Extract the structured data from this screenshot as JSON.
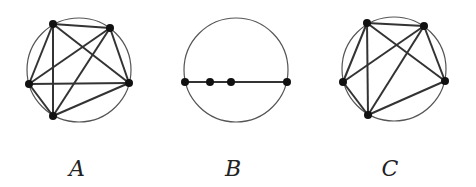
{
  "figures": [
    {
      "label": "A",
      "circle": {
        "cx": 79,
        "cy": 70,
        "r": 52
      },
      "points": [
        [
          53,
          24
        ],
        [
          110,
          28
        ],
        [
          129,
          83
        ],
        [
          53,
          116
        ],
        [
          29,
          84
        ]
      ],
      "edges": [
        [
          0,
          1
        ],
        [
          0,
          2
        ],
        [
          0,
          3
        ],
        [
          0,
          4
        ],
        [
          1,
          2
        ],
        [
          1,
          3
        ],
        [
          1,
          4
        ],
        [
          2,
          3
        ],
        [
          2,
          4
        ],
        [
          3,
          4
        ]
      ],
      "label_pos": [
        77,
        168
      ]
    },
    {
      "label": "B",
      "circle": {
        "cx": 236,
        "cy": 70,
        "r": 52
      },
      "points": [
        [
          185,
          82
        ],
        [
          210,
          82
        ],
        [
          231,
          82
        ],
        [
          287,
          82
        ]
      ],
      "edges": [
        [
          0,
          1
        ],
        [
          1,
          2
        ],
        [
          2,
          3
        ]
      ],
      "label_pos": [
        233,
        168
      ]
    },
    {
      "label": "C",
      "circle": {
        "cx": 394,
        "cy": 69,
        "r": 52
      },
      "points": [
        [
          367,
          23
        ],
        [
          424,
          26
        ],
        [
          445,
          81
        ],
        [
          368,
          115
        ],
        [
          343,
          82
        ]
      ],
      "edges": [
        [
          0,
          1
        ],
        [
          0,
          2
        ],
        [
          0,
          3
        ],
        [
          0,
          4
        ],
        [
          1,
          2
        ],
        [
          1,
          3
        ],
        [
          1,
          4
        ],
        [
          2,
          3
        ],
        [
          3,
          4
        ]
      ],
      "label_pos": [
        390,
        168
      ]
    }
  ],
  "colors": {
    "stroke": "#333333",
    "point": "#111111"
  }
}
